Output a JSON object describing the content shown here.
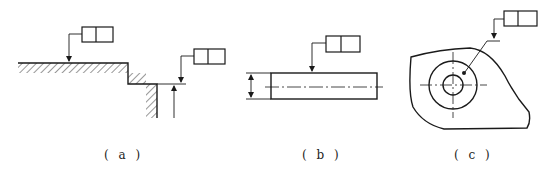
{
  "figure": {
    "type": "geometric-tolerance-drawing",
    "line_color": "#1a1a1a",
    "background": "#ffffff",
    "panels": [
      {
        "id": "a",
        "caption": "( a )",
        "description": "Stepped surface with hatching; two feature control frames with leader arrows, one pointing to top surface, one to lower step extension line",
        "tolerance_frames": 2
      },
      {
        "id": "b",
        "caption": "( b )",
        "description": "Cylindrical shaft side view with center line and dimension arrows; feature control frame leader to top edge",
        "tolerance_frames": 1
      },
      {
        "id": "c",
        "caption": "( c )",
        "description": "Irregular plate with concentric circles and center lines; feature control frame leader to dot on annular face",
        "tolerance_frames": 1
      }
    ]
  }
}
